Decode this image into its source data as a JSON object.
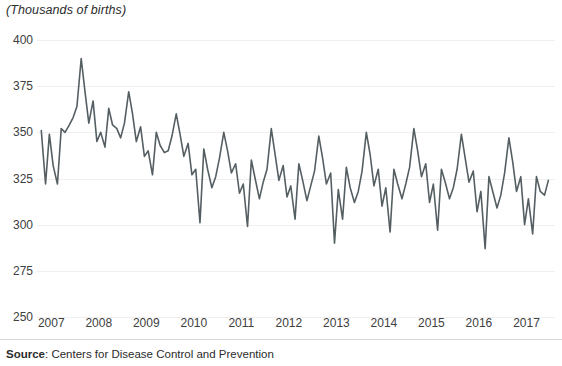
{
  "chart_data": {
    "type": "line",
    "title": "(Thousands of births)",
    "xlabel": "",
    "ylabel": "(Thousands of births)",
    "ylim": [
      250,
      400
    ],
    "yticks": [
      250,
      275,
      300,
      325,
      350,
      375,
      400
    ],
    "ytick_labels": [
      "250",
      "275",
      "300",
      "325",
      "350",
      "375",
      "400"
    ],
    "xlim": [
      2006.7,
      2017.6
    ],
    "xticks": [
      2007,
      2008,
      2009,
      2010,
      2011,
      2012,
      2013,
      2014,
      2015,
      2016,
      2017
    ],
    "xtick_labels": [
      "2007",
      "2008",
      "2009",
      "2010",
      "2011",
      "2012",
      "2013",
      "2014",
      "2015",
      "2016",
      "2017"
    ],
    "grid": true,
    "legend": null,
    "line_color": "#555f63",
    "series": [
      {
        "name": "Monthly births (thousands)",
        "x": [
          2006.79,
          2006.88,
          2006.96,
          2007.04,
          2007.13,
          2007.21,
          2007.29,
          2007.38,
          2007.46,
          2007.54,
          2007.63,
          2007.71,
          2007.79,
          2007.88,
          2007.96,
          2008.04,
          2008.13,
          2008.21,
          2008.29,
          2008.38,
          2008.46,
          2008.54,
          2008.63,
          2008.71,
          2008.79,
          2008.88,
          2008.96,
          2009.04,
          2009.13,
          2009.21,
          2009.29,
          2009.38,
          2009.46,
          2009.54,
          2009.63,
          2009.71,
          2009.79,
          2009.88,
          2009.96,
          2010.04,
          2010.13,
          2010.21,
          2010.29,
          2010.38,
          2010.46,
          2010.54,
          2010.63,
          2010.71,
          2010.79,
          2010.88,
          2010.96,
          2011.04,
          2011.13,
          2011.21,
          2011.29,
          2011.38,
          2011.46,
          2011.54,
          2011.63,
          2011.71,
          2011.79,
          2011.88,
          2011.96,
          2012.04,
          2012.13,
          2012.21,
          2012.29,
          2012.38,
          2012.46,
          2012.54,
          2012.63,
          2012.71,
          2012.79,
          2012.88,
          2012.96,
          2013.04,
          2013.13,
          2013.21,
          2013.29,
          2013.38,
          2013.46,
          2013.54,
          2013.63,
          2013.71,
          2013.79,
          2013.88,
          2013.96,
          2014.04,
          2014.13,
          2014.21,
          2014.29,
          2014.38,
          2014.46,
          2014.54,
          2014.63,
          2014.71,
          2014.79,
          2014.88,
          2014.96,
          2015.04,
          2015.13,
          2015.21,
          2015.29,
          2015.38,
          2015.46,
          2015.54,
          2015.63,
          2015.71,
          2015.79,
          2015.88,
          2015.96,
          2016.04,
          2016.13,
          2016.21,
          2016.29,
          2016.38,
          2016.46,
          2016.54,
          2016.63,
          2016.71,
          2016.79,
          2016.88,
          2016.96,
          2017.04,
          2017.13,
          2017.21,
          2017.29,
          2017.38,
          2017.46
        ],
        "values": [
          351,
          322,
          349,
          332,
          322,
          352,
          350,
          354,
          358,
          364,
          390,
          372,
          355,
          367,
          345,
          350,
          342,
          363,
          354,
          352,
          347,
          355,
          372,
          360,
          345,
          353,
          337,
          340,
          327,
          350,
          343,
          339,
          340,
          348,
          360,
          349,
          337,
          344,
          327,
          330,
          301,
          341,
          330,
          320,
          326,
          336,
          350,
          340,
          328,
          333,
          317,
          322,
          299,
          335,
          325,
          314,
          323,
          330,
          352,
          338,
          324,
          332,
          315,
          321,
          303,
          333,
          324,
          313,
          321,
          329,
          348,
          336,
          322,
          328,
          290,
          319,
          303,
          331,
          320,
          312,
          318,
          329,
          350,
          338,
          321,
          330,
          310,
          320,
          296,
          330,
          322,
          314,
          322,
          331,
          352,
          340,
          326,
          333,
          312,
          322,
          297,
          330,
          323,
          314,
          320,
          330,
          349,
          336,
          323,
          329,
          307,
          318,
          287,
          326,
          318,
          309,
          316,
          328,
          347,
          334,
          318,
          326,
          300,
          314,
          295,
          326,
          318,
          316,
          324
        ]
      }
    ]
  },
  "source": {
    "label": "Source",
    "separator": ": ",
    "text": "Centers for Disease Control and Prevention"
  }
}
